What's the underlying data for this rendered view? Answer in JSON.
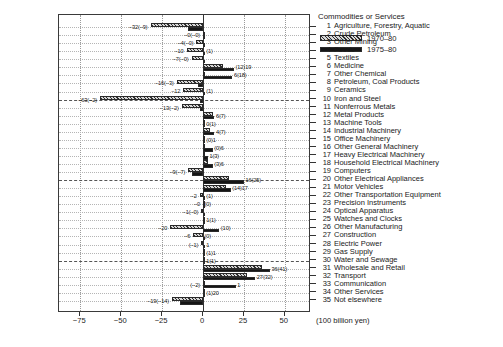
{
  "chart_data": {
    "type": "bar",
    "orientation": "horizontal",
    "title": "",
    "xlabel": "(100 billion yen)",
    "ylabel": "Commodities or Services",
    "xlim": [
      -88,
      66
    ],
    "xticks": [
      -75,
      -50,
      -25,
      0,
      25,
      50
    ],
    "xticklabels": [
      "−75",
      "−50",
      "−25",
      "0",
      "25",
      "50"
    ],
    "grid": "dotted vertical gridlines at 25-unit steps, dotted horizontal per row, dashed every 10th category",
    "legend_position": "inside top-right of plot area",
    "categories": [
      "Agriculture, Forestry, Aquatic",
      "Crude Petroleum",
      "Other Mining",
      "Foods",
      "Textiles",
      "Medicine",
      "Other Chemical",
      "Petroleum, Coal Products",
      "Ceramics",
      "Iron and Steel",
      "Nonferrous Metals",
      "Metal Products",
      "Machine Tools",
      "Industrial Machinery",
      "Office Machinery",
      "Other General Machinery",
      "Heavy Electrical Machinery",
      "Household Electrical Machinery",
      "Computers",
      "Other Electrical Appliances",
      "Motor Vehicles",
      "Other Transportation Equipment",
      "Precision Instruments",
      "Optical Apparatus",
      "Watches and Clocks",
      "Other Manufacturing",
      "Construction",
      "Electric Power",
      "Gas Supply",
      "Water and Sewage",
      "Wholesale and Retail",
      "Transport",
      "Communication",
      "Other Services",
      "Not elsewhere"
    ],
    "series": [
      {
        "name": "1970–80",
        "values": [
          -32,
          0,
          -4,
          -10,
          -7,
          12,
          1,
          -16,
          -12,
          -63,
          -13,
          6,
          0,
          4,
          0,
          0,
          1,
          3,
          -9,
          16,
          14,
          -2,
          0,
          -1,
          1,
          -20,
          -6,
          -1,
          1,
          1,
          36,
          27,
          1,
          1,
          -19
        ]
      },
      {
        "name": "1975–80",
        "values": [
          -9,
          0,
          0,
          1,
          0,
          19,
          18,
          -3,
          1,
          -2,
          -2,
          7,
          1,
          7,
          1,
          6,
          3,
          6,
          -7,
          25,
          17,
          1,
          0,
          0,
          1,
          10,
          0,
          1,
          1,
          1,
          41,
          32,
          20,
          1,
          -14
        ]
      }
    ],
    "point_labels": [
      {
        "n": 1,
        "side": "left",
        "text": "−32(−9)"
      },
      {
        "n": 2,
        "side": "left",
        "text": "−0(−0)"
      },
      {
        "n": 3,
        "side": "left",
        "text": "−4(−0)"
      },
      {
        "n": 4,
        "side": "left",
        "text": "−10"
      },
      {
        "n": 4,
        "side": "right",
        "text": "(1)"
      },
      {
        "n": 5,
        "side": "left",
        "text": "−7(−0)"
      },
      {
        "n": 6,
        "side": "right",
        "text": "(12)19"
      },
      {
        "n": 7,
        "side": "right",
        "text": "6(18)"
      },
      {
        "n": 8,
        "side": "left",
        "text": "−16(−3)"
      },
      {
        "n": 9,
        "side": "left",
        "text": "−12"
      },
      {
        "n": 9,
        "side": "right",
        "text": "(1)"
      },
      {
        "n": 10,
        "side": "left",
        "text": "−63(−2)"
      },
      {
        "n": 11,
        "side": "left",
        "text": "−13(−2)"
      },
      {
        "n": 12,
        "side": "right",
        "text": "6(7)"
      },
      {
        "n": 13,
        "side": "right",
        "text": "0(1)"
      },
      {
        "n": 14,
        "side": "right",
        "text": "4(7)"
      },
      {
        "n": 15,
        "side": "right",
        "text": "(0)1"
      },
      {
        "n": 16,
        "side": "right",
        "text": "(0)6"
      },
      {
        "n": 17,
        "side": "right",
        "text": "1(3)"
      },
      {
        "n": 18,
        "side": "right",
        "text": "(3)6"
      },
      {
        "n": 19,
        "side": "left",
        "text": "−9(−7)"
      },
      {
        "n": 20,
        "side": "right",
        "text": "16(25)"
      },
      {
        "n": 21,
        "side": "right",
        "text": "(14)17"
      },
      {
        "n": 22,
        "side": "left",
        "text": "−2"
      },
      {
        "n": 22,
        "side": "right",
        "text": "(1)"
      },
      {
        "n": 23,
        "side": "left",
        "text": "−0"
      },
      {
        "n": 23,
        "side": "right",
        "text": "(0)"
      },
      {
        "n": 24,
        "side": "left",
        "text": "−1(−0)"
      },
      {
        "n": 25,
        "side": "right",
        "text": "1(1)"
      },
      {
        "n": 26,
        "side": "left",
        "text": "−20"
      },
      {
        "n": 26,
        "side": "right",
        "text": "(10)"
      },
      {
        "n": 27,
        "side": "left",
        "text": "−6"
      },
      {
        "n": 27,
        "side": "right",
        "text": "(0)"
      },
      {
        "n": 28,
        "side": "left",
        "text": "(−1)"
      },
      {
        "n": 28,
        "side": "right",
        "text": "1"
      },
      {
        "n": 29,
        "side": "right",
        "text": "(1)1"
      },
      {
        "n": 30,
        "side": "right",
        "text": "1(1)"
      },
      {
        "n": 31,
        "side": "right",
        "text": "36(41)"
      },
      {
        "n": 32,
        "side": "right",
        "text": "27(32)"
      },
      {
        "n": 33,
        "side": "left",
        "text": "(−2)"
      },
      {
        "n": 33,
        "side": "right",
        "text": "1"
      },
      {
        "n": 34,
        "side": "right",
        "text": "(1)20"
      },
      {
        "n": 35,
        "side": "left",
        "text": "−19(−14)"
      }
    ]
  },
  "legend": {
    "items": [
      {
        "label": "1970–80",
        "swatch": "hatched"
      },
      {
        "label": "1975–80",
        "swatch": "solid"
      }
    ]
  },
  "category_header": "Commodities or Services",
  "axis_unit": "(100 billion yen)",
  "colors": {
    "hatch_fill": "#d8d8d8",
    "hatch_line": "#2d2d2d",
    "solid_fill": "#151515",
    "frame": "#3a3a3a",
    "grid": "#9a9a9a"
  }
}
